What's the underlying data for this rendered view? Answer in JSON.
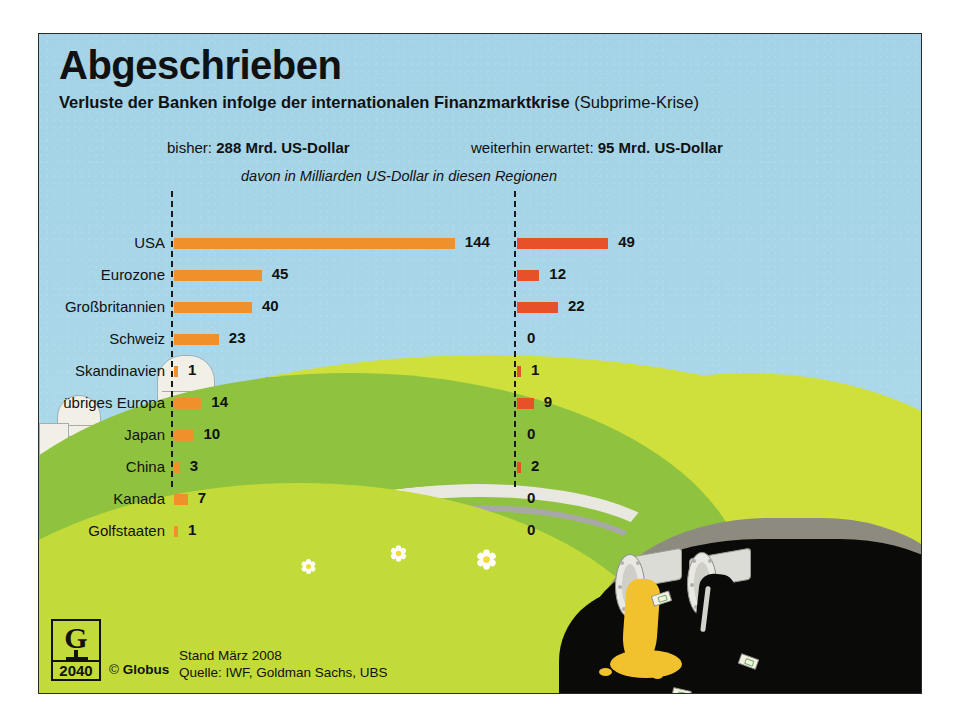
{
  "poster": {
    "title": "Abgeschrieben",
    "subtitle_bold": "Verluste der Banken infolge der internationalen Finanzmarktkrise",
    "subtitle_light": " (Subprime-Krise)",
    "left_total_label": "bisher: ",
    "left_total_value": "288 Mrd. US-Dollar",
    "right_total_label": "weiterhin erwartet: ",
    "right_total_value": "95 Mrd. US-Dollar",
    "unit_note": "davon in Milliarden US-Dollar in diesen Regionen"
  },
  "footer": {
    "logo_letter": "G",
    "logo_number": "2040",
    "copyright_symbol": "©",
    "copyright_name": "Globus",
    "date_line": "Stand März 2008",
    "source_line": "Quelle: IWF, Goldman Sachs, UBS"
  },
  "colors": {
    "sky": "#a9d6e7",
    "bar_left": "#f0902a",
    "bar_right": "#e8502a",
    "grass_light": "#cfe03c",
    "grass_mid": "#8fc33f",
    "gold": "#f2c12e",
    "pit": "#0a0a08",
    "rim": "#8d8a80",
    "frame": "#2b2b2b"
  },
  "chart_data": {
    "type": "bar",
    "title": "Abgeschrieben",
    "subtitle": "Verluste der Banken infolge der internationalen Finanzmarktkrise (Subprime-Krise)",
    "xlabel": "",
    "ylabel": "",
    "annotation": "davon in Milliarden US-Dollar in diesen Regionen",
    "unit": "Milliarden US-Dollar",
    "grid": false,
    "legend_position": "top",
    "categories": [
      "USA",
      "Eurozone",
      "Großbritannien",
      "Schweiz",
      "Skandinavien",
      "übriges Europa",
      "Japan",
      "China",
      "Kanada",
      "Golfstaaten"
    ],
    "series": [
      {
        "name": "bisher",
        "header": "bisher: 288 Mrd. US-Dollar",
        "total": 288,
        "color": "#f0902a",
        "values": [
          144,
          45,
          40,
          23,
          1,
          14,
          10,
          3,
          7,
          1
        ]
      },
      {
        "name": "weiterhin erwartet",
        "header": "weiterhin erwartet: 95 Mrd. US-Dollar",
        "total": 95,
        "color": "#e8502a",
        "values": [
          49,
          12,
          22,
          0,
          1,
          9,
          0,
          2,
          0,
          0
        ]
      }
    ],
    "xlim": [
      0,
      150
    ],
    "source": "Quelle: IWF, Goldman Sachs, UBS",
    "date": "Stand März 2008"
  }
}
